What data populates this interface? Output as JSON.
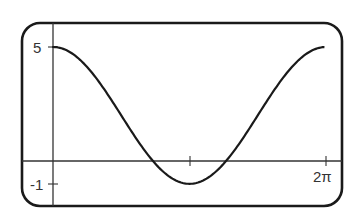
{
  "chart_data": {
    "type": "line",
    "title": "",
    "xlabel": "",
    "ylabel": "",
    "function": "y = 2 + 3cos(x)",
    "xlim": [
      0,
      6.2832
    ],
    "ylim": [
      -1,
      5
    ],
    "x_ticks": [
      {
        "value": 3.1416,
        "label": ""
      },
      {
        "value": 6.2832,
        "label": "2π"
      }
    ],
    "y_ticks": [
      {
        "value": 5,
        "label": "5"
      },
      {
        "value": -1,
        "label": "-1"
      }
    ],
    "series": [
      {
        "name": "curve",
        "x": [
          0,
          0.7854,
          1.5708,
          2.3562,
          3.1416,
          3.927,
          4.7124,
          5.4978,
          6.2832
        ],
        "values": [
          5,
          4.12,
          2,
          -0.12,
          -1,
          -0.12,
          2,
          4.12,
          5
        ]
      }
    ],
    "grid": false,
    "legend": "none"
  },
  "labels": {
    "y_max": "5",
    "y_min": "-1",
    "x_max": "2π"
  },
  "colors": {
    "line": "#1a1a1a",
    "axis": "#333333",
    "frame": "#1a1a1a",
    "background": "#ffffff"
  }
}
